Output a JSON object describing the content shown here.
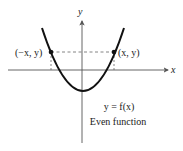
{
  "diagram": {
    "axes": {
      "x_label": "x",
      "y_label": "y"
    },
    "curve": {
      "type": "parabola",
      "equation_label": "y = f(x)"
    },
    "points": [
      {
        "label": "(−x, y)",
        "side": "left"
      },
      {
        "label": "(x, y)",
        "side": "right"
      }
    ],
    "caption": "Even function",
    "colors": {
      "curve": "#111111",
      "axes": "#555555",
      "dashed": "#666666",
      "text": "#1a1a1a"
    }
  }
}
